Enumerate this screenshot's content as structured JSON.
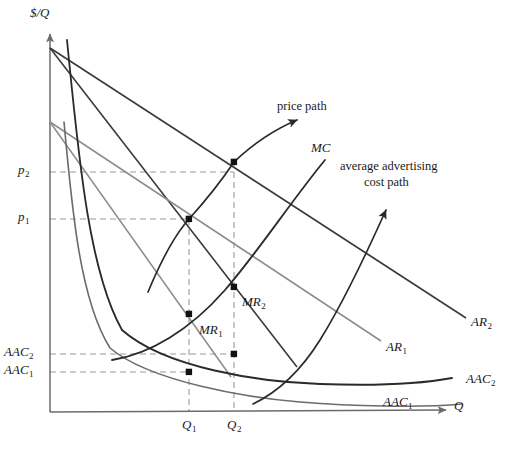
{
  "figure": {
    "type": "economics-diagram",
    "axes": {
      "y_axis_label": "$/Q",
      "x_axis_label": "Q",
      "origin": {
        "x": 50,
        "y": 412
      },
      "y_axis_top": {
        "x": 50,
        "y": 28
      },
      "x_axis_right": {
        "x": 452,
        "y": 412
      }
    },
    "y_ticks": [
      {
        "name": "p2",
        "text": "p",
        "sub": "2",
        "value_y": 172,
        "x": 18
      },
      {
        "name": "p1",
        "text": "p",
        "sub": "1",
        "value_y": 219,
        "x": 18
      },
      {
        "name": "AAC2",
        "text": "AAC",
        "sub": "2",
        "value_y": 354,
        "x": 8
      },
      {
        "name": "AAC1",
        "text": "AAC",
        "sub": "1",
        "value_y": 372,
        "x": 8
      }
    ],
    "x_ticks": [
      {
        "name": "Q1",
        "text": "Q",
        "sub": "1",
        "value_x": 189,
        "y": 420
      },
      {
        "name": "Q2",
        "text": "Q",
        "sub": "2",
        "value_x": 234,
        "y": 420
      }
    ],
    "curve_labels": [
      {
        "name": "price-path",
        "text": "price path",
        "x": 277,
        "y": 100,
        "italic": false
      },
      {
        "name": "mc-label",
        "text": "MC",
        "sub": "",
        "x": 311,
        "y": 142,
        "italic": true
      },
      {
        "name": "advertising-cost-path-line1",
        "text": "average advertising",
        "x": 340,
        "y": 160,
        "italic": false
      },
      {
        "name": "advertising-cost-path-line2",
        "text": "cost path",
        "x": 364,
        "y": 176,
        "italic": false
      },
      {
        "name": "AR2-label",
        "text": "AR",
        "sub": "2",
        "x": 471,
        "y": 316,
        "italic": true
      },
      {
        "name": "AR1-label",
        "text": "AR",
        "sub": "1",
        "x": 386,
        "y": 341,
        "italic": true
      },
      {
        "name": "MR1-label",
        "text": "MR",
        "sub": "1",
        "x": 199,
        "y": 324,
        "italic": true
      },
      {
        "name": "MR2-label",
        "text": "MR",
        "sub": "2",
        "x": 242,
        "y": 296,
        "italic": true
      },
      {
        "name": "AAC1-label",
        "text": "AAC",
        "sub": "1",
        "x": 383,
        "y": 396,
        "italic": true
      },
      {
        "name": "AAC2-label",
        "text": "AAC",
        "sub": "2",
        "x": 466,
        "y": 373,
        "italic": true
      }
    ],
    "curves": {
      "AR2": {
        "name": "average-revenue-2",
        "from": [
          50,
          48
        ],
        "to": [
          466,
          318
        ],
        "color": "#3a3a3a",
        "width": 1.6
      },
      "MR2": {
        "name": "marginal-revenue-2",
        "from": [
          50,
          48
        ],
        "to": [
          296,
          366
        ],
        "color": "#3a3a3a",
        "width": 1.6
      },
      "AR1": {
        "name": "average-revenue-1",
        "from": [
          50,
          122
        ],
        "to": [
          380,
          340
        ],
        "color": "#8c8c8c",
        "width": 1.5
      },
      "MR1": {
        "name": "marginal-revenue-1",
        "from": [
          50,
          122
        ],
        "to": [
          230,
          376
        ],
        "color": "#8c8c8c",
        "width": 1.5
      },
      "AAC2_curve": {
        "name": "average-advertising-cost-2",
        "color": "#2a2a2a",
        "width": 1.8
      },
      "AAC1_curve": {
        "name": "average-advertising-cost-1",
        "color": "#6b6b6b",
        "width": 1.6
      },
      "MC": {
        "name": "marginal-cost",
        "color": "#2a2a2a",
        "width": 1.8
      },
      "price_path": {
        "name": "price-path-arrow",
        "color": "#2a2a2a",
        "width": 1.7
      },
      "ad_cost_path": {
        "name": "advertising-cost-path-arrow",
        "color": "#2a2a2a",
        "width": 1.7
      }
    },
    "equilibrium_points": [
      {
        "name": "point-p2-Q2",
        "x": 234,
        "y": 162,
        "label": "price 2 at quantity 2"
      },
      {
        "name": "point-p1-Q1",
        "x": 189,
        "y": 219,
        "label": "price 1 at quantity 1"
      },
      {
        "name": "point-MR1",
        "x": 189,
        "y": 314,
        "label": "marginal revenue 1 equals marginal cost"
      },
      {
        "name": "point-MR2",
        "x": 234,
        "y": 287,
        "label": "marginal revenue 2 equals marginal cost"
      },
      {
        "name": "point-AAC2-Q2",
        "x": 234,
        "y": 354,
        "label": "average advertising cost 2"
      },
      {
        "name": "point-AAC1-Q1",
        "x": 189,
        "y": 372,
        "label": "average advertising cost 1"
      }
    ],
    "dashed_guides": {
      "color": "#9a9a9a",
      "dash": "6 4",
      "width": 1.1
    }
  }
}
